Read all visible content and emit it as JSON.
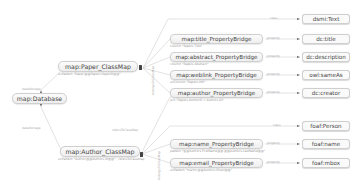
{
  "diagram": {
    "type": "D2RQ mapping graph",
    "database": {
      "label": "map:Database"
    },
    "class_maps": [
      {
        "id": "paper",
        "label": "map:Paper_ClassMap",
        "sub": "uriPattern \"Paper/@@Papers.PaperID@@\"",
        "edge_from_db": "dataStorage",
        "class_edge_label": "class",
        "class": "dsmi:Text",
        "bridges_group_label": "belongsToClassMap",
        "bridges": [
          {
            "label": "map:title_PropertyBridge",
            "sub": "column \"Papers.Title\"",
            "edge": "property",
            "target": "dc:title"
          },
          {
            "label": "map:abstract_PropertyBridge",
            "sub": "column \"Papers.Abstract\"",
            "edge": "property",
            "target": "dc:description"
          },
          {
            "label": "map:weblink_PropertyBridge",
            "sub": "uriColumn \"Papers.URI\"",
            "edge": "property",
            "target": "owl:sameAs"
          },
          {
            "label": "map:author_PropertyBridge",
            "sub": "join \"Papers.AuthorID = Authors.ID\"",
            "edge": "property",
            "target": "dc:creator"
          }
        ]
      },
      {
        "id": "author",
        "label": "map:Author_ClassMap",
        "sub": "uriPattern \"Author/@@Authors.ID@@\" ; refersToClassMap",
        "edge_from_db": "dataStorage",
        "ref_edge_label": "refersToClassMap",
        "class_edge_label": "class",
        "class": "foaf:Person",
        "bridges_group_label": "belongsToClassMap",
        "bridges": [
          {
            "label": "map:name_PropertyBridge",
            "sub": "pattern \"@@Authors.FirstName@@ @@Authors.LastName@@\"",
            "edge": "property",
            "target": "foaf:name"
          },
          {
            "label": "map:email_PropertyBridge",
            "sub": "uriPattern \"mailto:@@Authors.Email@@\"",
            "edge": "property",
            "target": "foaf:mbox"
          }
        ]
      }
    ]
  }
}
